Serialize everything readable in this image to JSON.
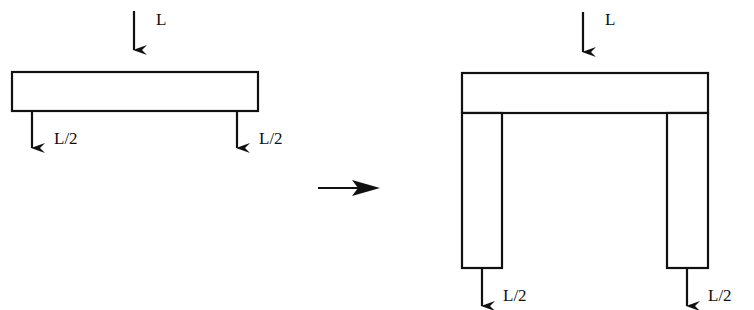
{
  "diagram": {
    "left": {
      "load_label": "L",
      "left_support_label": "L/2",
      "right_support_label": "L/2"
    },
    "transition": {
      "arrow": "right-arrow"
    },
    "right": {
      "load_label": "L",
      "left_leg_label": "L/2",
      "right_leg_label": "L/2"
    },
    "colors": {
      "stroke": "#111111",
      "fill": "#ffffff"
    }
  }
}
